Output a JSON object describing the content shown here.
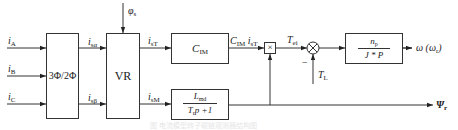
{
  "diagram": {
    "type": "block-diagram",
    "inputs": [
      {
        "id": "iA",
        "symbol": "i",
        "sub": "A"
      },
      {
        "id": "iB",
        "symbol": "i",
        "sub": "B"
      },
      {
        "id": "iC",
        "symbol": "i",
        "sub": "C"
      }
    ],
    "blocks": {
      "transform": {
        "label": "3Φ/2Φ"
      },
      "rotator": {
        "label": "VR"
      },
      "cim": {
        "symbol": "C",
        "sub": "IM"
      },
      "multiplier": {
        "label": "×"
      },
      "summer": {
        "label": "⊗",
        "minus_sign": "−"
      },
      "mech": {
        "num_symbol": "n",
        "num_sub": "p",
        "den": "J * P"
      },
      "flux": {
        "num_symbol": "L",
        "num_sub": "md",
        "den_symbol": "T",
        "den_sub": "r",
        "den_rest": "p +1"
      }
    },
    "signals": {
      "isa": {
        "symbol": "i",
        "sub": "sα"
      },
      "isb": {
        "symbol": "i",
        "sub": "sβ"
      },
      "phis": {
        "symbol": "φ",
        "sub": "s"
      },
      "isT": {
        "symbol": "i",
        "sub": "sT"
      },
      "isM": {
        "symbol": "i",
        "sub": "sM"
      },
      "cim_out": {
        "text": "C",
        "sub1": "IM",
        "mid": " i",
        "sub2": "sT"
      },
      "tei": {
        "symbol": "T",
        "sub": "ei"
      },
      "tl": {
        "symbol": "T",
        "sub": "L"
      },
      "omega": {
        "text": "ω (ω",
        "sub": "r",
        "close": ")"
      },
      "psi": {
        "symbol": "Ψ",
        "sub": "r"
      }
    },
    "caption": "图 电流模型转子磁链观测器结构图"
  }
}
